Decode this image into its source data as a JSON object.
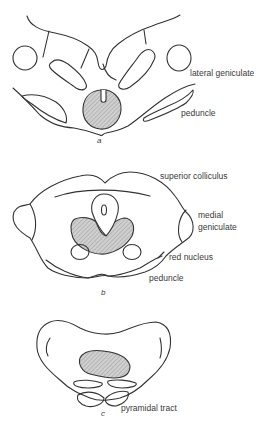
{
  "figure": {
    "panels": [
      {
        "letter": "a",
        "labels": {
          "lateral_geniculate": "lateral geniculate",
          "peduncle": "peduncle"
        }
      },
      {
        "letter": "b",
        "labels": {
          "superior_colliculus": "superior colliculus",
          "medial_geniculate_1": "medial",
          "medial_geniculate_2": "geniculate",
          "red_nucleus": "red nucleus",
          "peduncle": "peduncle"
        }
      },
      {
        "letter": "c",
        "labels": {
          "pyramidal_tract": "pyramidal tract"
        }
      }
    ],
    "colors": {
      "stroke": "#333333",
      "hatch_fill": "#c8c8c8",
      "hatch_line": "#888888",
      "text": "#3a3a3a"
    }
  }
}
